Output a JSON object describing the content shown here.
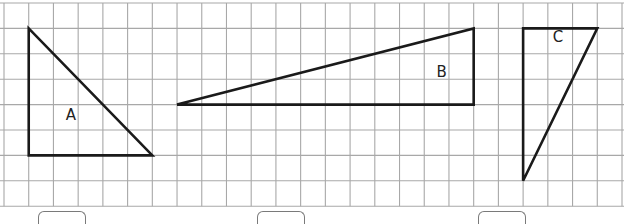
{
  "grid": {
    "origin_x": 4,
    "origin_y": 3,
    "cell_w": 24.72,
    "cell_h": 25.4,
    "cols": 25,
    "rows": 8,
    "line_color": "#a8a8a8"
  },
  "shapes": [
    {
      "id": "A",
      "label": "A",
      "type": "right-triangle",
      "vertices_grid": [
        [
          1,
          1
        ],
        [
          1,
          6
        ],
        [
          6,
          6
        ]
      ],
      "label_pos": [
        2.5,
        4.6
      ]
    },
    {
      "id": "B",
      "label": "B",
      "type": "right-triangle",
      "vertices_grid": [
        [
          7,
          4
        ],
        [
          19,
          1
        ],
        [
          19,
          4
        ]
      ],
      "label_pos": [
        17.5,
        2.9
      ]
    },
    {
      "id": "C",
      "label": "C",
      "type": "right-triangle",
      "vertices_grid": [
        [
          21,
          1
        ],
        [
          24,
          1
        ],
        [
          21,
          7
        ]
      ],
      "label_pos": [
        22.2,
        1.55
      ]
    }
  ],
  "answer_boxes": [
    {
      "for": "A",
      "left": 38,
      "value": ""
    },
    {
      "for": "B",
      "left": 257,
      "value": ""
    },
    {
      "for": "C",
      "left": 478,
      "value": ""
    }
  ],
  "style": {
    "stroke": "#1a1a1a",
    "stroke_width": 2.6
  }
}
